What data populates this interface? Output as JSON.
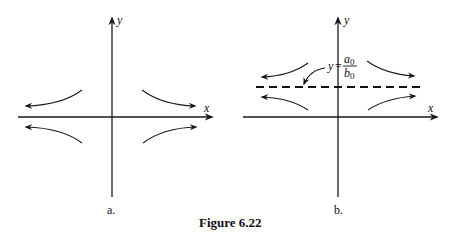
{
  "figure": {
    "caption": "Figure 6.22",
    "panels": [
      {
        "id": "a",
        "label": "a.",
        "x_axis_label": "x",
        "y_axis_label": "y",
        "description": "Saddle-like phase portrait: trajectories approach the y-axis direction from near the x-axis and flow outward along the x-axis, symmetric about the x-axis (equilibrium line y = 0)."
      },
      {
        "id": "b",
        "label": "b.",
        "x_axis_label": "x",
        "y_axis_label": "y",
        "equilibrium_line": {
          "lhs": "y",
          "eq": "=",
          "numerator": "a",
          "numerator_sub": "0",
          "denominator": "b",
          "denominator_sub": "0",
          "style": "dashed"
        },
        "description": "Same portrait shifted so trajectories are symmetric about the dashed horizontal line y = a0/b0."
      }
    ]
  },
  "colors": {
    "ink": "#1a1a1a",
    "background": "#ffffff"
  }
}
